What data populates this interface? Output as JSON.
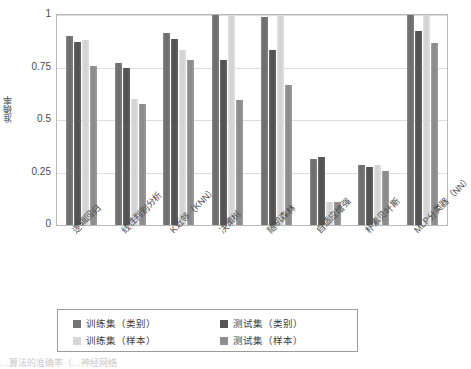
{
  "chart_data": {
    "type": "bar",
    "title": "",
    "xlabel": "",
    "ylabel": "准确率",
    "ylim": [
      0,
      1
    ],
    "yticks": [
      "0",
      "0.25",
      "0.5",
      "0.75",
      "1"
    ],
    "ytick_values": [
      0,
      0.25,
      0.5,
      0.75,
      1
    ],
    "grid": true,
    "legend_position": "bottom",
    "categories": [
      "逻辑回归",
      "线性判别分析",
      "K近邻（KNN）",
      "决策树",
      "随机森林",
      "自适应增强",
      "朴素贝叶斯",
      "MLP分类器（NN）"
    ],
    "series": [
      {
        "name": "训练集（类别）",
        "color": "#737373",
        "values": [
          0.9,
          0.77,
          0.915,
          1.0,
          0.99,
          0.315,
          0.285,
          1.0
        ]
      },
      {
        "name": "测试集（类别）",
        "color": "#565656",
        "values": [
          0.87,
          0.75,
          0.885,
          0.785,
          0.835,
          0.325,
          0.275,
          0.925
        ]
      },
      {
        "name": "训练集（样本）",
        "color": "#d6d6d6",
        "values": [
          0.88,
          0.6,
          0.835,
          1.0,
          1.0,
          0.11,
          0.285,
          1.0
        ]
      },
      {
        "name": "测试集（样本）",
        "color": "#8f8f8f",
        "values": [
          0.755,
          0.575,
          0.785,
          0.595,
          0.665,
          0.11,
          0.255,
          0.865
        ]
      }
    ]
  },
  "legend": {
    "entries": [
      {
        "label": "训练集（类别）",
        "swatch": "#737373"
      },
      {
        "label": "测试集（类别）",
        "swatch": "#565656"
      },
      {
        "label": "训练集（样本）",
        "swatch": "#d6d6d6"
      },
      {
        "label": "测试集（样本）",
        "swatch": "#8f8f8f"
      }
    ]
  },
  "caption": {
    "text": "…算法的准确率（…神经网络"
  }
}
